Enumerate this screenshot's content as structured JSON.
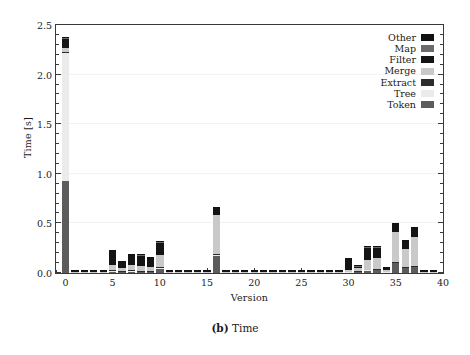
{
  "figure": {
    "caption_label": "(b)",
    "caption_text": "Time"
  },
  "chart_data": {
    "type": "bar",
    "stacked": true,
    "title": "",
    "xlabel": "Version",
    "ylabel": "Time [s]",
    "xlim": [
      -1,
      40
    ],
    "ylim": [
      0.0,
      2.5
    ],
    "ytick_labels": [
      "0.0",
      "0.5",
      "1.0",
      "1.5",
      "2.0",
      "2.5"
    ],
    "ytick_values": [
      0.0,
      0.5,
      1.0,
      1.5,
      2.0,
      2.5
    ],
    "ytick_minor_step": 0.1,
    "xtick_labels": [
      "0",
      "5",
      "10",
      "15",
      "20",
      "25",
      "30",
      "35",
      "40"
    ],
    "xtick_values": [
      0,
      5,
      10,
      15,
      20,
      25,
      30,
      35,
      40
    ],
    "xtick_minor_step": 1,
    "grid": "horizontal-faint",
    "legend_position": "top-right",
    "legend_order_top_to_bottom": [
      "Other",
      "Map",
      "Filter",
      "Merge",
      "Extract",
      "Tree",
      "Token"
    ],
    "colors": {
      "Other": "#111111",
      "Map": "#6b6b6b",
      "Filter": "#141414",
      "Merge": "#c9c9c9",
      "Extract": "#2d2d2d",
      "Tree": "#ebebeb",
      "Token": "#5c5c5c"
    },
    "series_stack_order_bottom_to_top": [
      "Token",
      "Tree",
      "Extract",
      "Merge",
      "Filter",
      "Map",
      "Other"
    ],
    "categories": [
      0,
      1,
      2,
      3,
      4,
      5,
      6,
      7,
      8,
      9,
      10,
      11,
      12,
      13,
      14,
      15,
      16,
      17,
      18,
      19,
      20,
      21,
      22,
      23,
      24,
      25,
      26,
      27,
      28,
      29,
      30,
      31,
      32,
      33,
      34,
      35,
      36,
      37,
      38,
      39
    ],
    "series": [
      {
        "name": "Token",
        "values": [
          0.93,
          0.004,
          0.004,
          0.004,
          0.004,
          0.018,
          0.012,
          0.018,
          0.014,
          0.015,
          0.04,
          0.004,
          0.004,
          0.004,
          0.004,
          0.004,
          0.175,
          0.004,
          0.004,
          0.004,
          0.004,
          0.004,
          0.004,
          0.004,
          0.004,
          0.004,
          0.004,
          0.004,
          0.004,
          0.004,
          0.008,
          0.01,
          0.026,
          0.03,
          0.008,
          0.1,
          0.05,
          0.06,
          0.004,
          0.004
        ]
      },
      {
        "name": "Tree",
        "values": [
          1.285,
          0.002,
          0.002,
          0.002,
          0.002,
          0.006,
          0.004,
          0.006,
          0.004,
          0.004,
          0.012,
          0.002,
          0.002,
          0.002,
          0.002,
          0.002,
          0.01,
          0.002,
          0.002,
          0.002,
          0.002,
          0.002,
          0.002,
          0.002,
          0.002,
          0.002,
          0.002,
          0.002,
          0.002,
          0.002,
          0.004,
          0.004,
          0.006,
          0.008,
          0.004,
          0.01,
          0.006,
          0.008,
          0.002,
          0.002
        ]
      },
      {
        "name": "Extract",
        "values": [
          0.012,
          0.001,
          0.001,
          0.001,
          0.001,
          0.002,
          0.002,
          0.002,
          0.002,
          0.002,
          0.004,
          0.001,
          0.001,
          0.001,
          0.001,
          0.001,
          0.004,
          0.001,
          0.001,
          0.001,
          0.001,
          0.001,
          0.001,
          0.001,
          0.001,
          0.001,
          0.001,
          0.001,
          0.001,
          0.001,
          0.002,
          0.002,
          0.003,
          0.003,
          0.002,
          0.004,
          0.003,
          0.003,
          0.001,
          0.001
        ]
      },
      {
        "name": "Merge",
        "values": [
          0.038,
          0.002,
          0.002,
          0.002,
          0.002,
          0.055,
          0.035,
          0.055,
          0.05,
          0.04,
          0.125,
          0.002,
          0.002,
          0.002,
          0.002,
          0.002,
          0.395,
          0.002,
          0.002,
          0.002,
          0.002,
          0.002,
          0.002,
          0.002,
          0.002,
          0.002,
          0.002,
          0.002,
          0.002,
          0.002,
          0.02,
          0.035,
          0.1,
          0.11,
          0.02,
          0.3,
          0.185,
          0.29,
          0.002,
          0.002
        ]
      },
      {
        "name": "Filter",
        "values": [
          0.095,
          0.014,
          0.014,
          0.014,
          0.014,
          0.14,
          0.06,
          0.105,
          0.11,
          0.09,
          0.13,
          0.014,
          0.014,
          0.014,
          0.014,
          0.014,
          0.075,
          0.014,
          0.014,
          0.014,
          0.014,
          0.014,
          0.014,
          0.014,
          0.014,
          0.014,
          0.014,
          0.014,
          0.014,
          0.014,
          0.11,
          0.018,
          0.125,
          0.11,
          0.018,
          0.08,
          0.08,
          0.095,
          0.018,
          0.018
        ]
      },
      {
        "name": "Map",
        "values": [
          0.005,
          0.001,
          0.001,
          0.001,
          0.001,
          0.002,
          0.002,
          0.002,
          0.002,
          0.002,
          0.003,
          0.001,
          0.001,
          0.001,
          0.001,
          0.001,
          0.003,
          0.001,
          0.001,
          0.001,
          0.001,
          0.001,
          0.001,
          0.001,
          0.001,
          0.001,
          0.001,
          0.001,
          0.001,
          0.001,
          0.002,
          0.001,
          0.002,
          0.002,
          0.001,
          0.003,
          0.002,
          0.003,
          0.001,
          0.001
        ]
      },
      {
        "name": "Other",
        "values": [
          0.015,
          0.002,
          0.002,
          0.002,
          0.002,
          0.005,
          0.003,
          0.005,
          0.004,
          0.004,
          0.006,
          0.002,
          0.002,
          0.002,
          0.002,
          0.002,
          0.008,
          0.002,
          0.002,
          0.002,
          0.002,
          0.002,
          0.002,
          0.002,
          0.002,
          0.002,
          0.002,
          0.002,
          0.002,
          0.002,
          0.004,
          0.003,
          0.006,
          0.006,
          0.003,
          0.008,
          0.006,
          0.007,
          0.003,
          0.003
        ]
      }
    ],
    "totals": [
      2.38,
      0.026,
      0.026,
      0.026,
      0.026,
      0.228,
      0.118,
      0.193,
      0.186,
      0.157,
      0.32,
      0.026,
      0.026,
      0.026,
      0.026,
      0.026,
      0.67,
      0.026,
      0.026,
      0.026,
      0.026,
      0.026,
      0.026,
      0.026,
      0.026,
      0.026,
      0.026,
      0.026,
      0.026,
      0.026,
      0.15,
      0.073,
      0.268,
      0.269,
      0.056,
      0.505,
      0.332,
      0.466,
      0.031,
      0.031
    ]
  }
}
